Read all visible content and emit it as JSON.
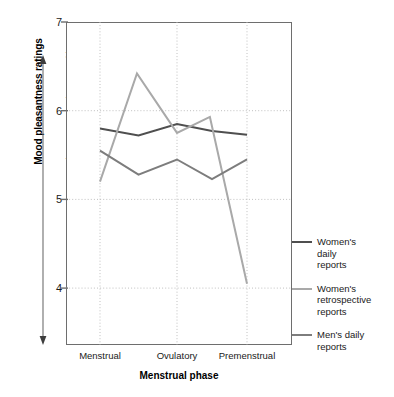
{
  "chart_data": {
    "type": "line",
    "title": "",
    "xlabel": "Menstrual phase",
    "ylabel": "Mood pleasantness ratings",
    "y_scale_low": "negative",
    "y_scale_mid": "neutral",
    "y_scale_high": "positive",
    "categories": [
      "Menstrual",
      "Ovulatory",
      "Premenstrual"
    ],
    "ylim": [
      3.2,
      7
    ],
    "yticks": [
      7,
      6,
      5,
      4
    ],
    "ytick_labels": [
      "7",
      "6",
      "5",
      "4"
    ],
    "grid": "dotted vertical at each phase, dotted horizontal at each y tick",
    "legend_position": "right",
    "series": [
      {
        "name": "Women's daily reports",
        "legend_label": "Women's\ndaily\nreports",
        "color": "#4f4f4f",
        "values": [
          5.8,
          5.85,
          5.73
        ],
        "vertices": [
          {
            "x": 0.0,
            "y": 5.8
          },
          {
            "x": 0.5,
            "y": 5.72
          },
          {
            "x": 1.0,
            "y": 5.85
          },
          {
            "x": 1.5,
            "y": 5.77
          },
          {
            "x": 2.0,
            "y": 5.73
          }
        ]
      },
      {
        "name": "Women's retrospective reports",
        "legend_label": "Women's\nretrospective\nreports",
        "color": "#a9a9a9",
        "values": [
          5.2,
          5.75,
          4.05
        ],
        "vertices": [
          {
            "x": 0.0,
            "y": 5.2
          },
          {
            "x": 0.48,
            "y": 6.42
          },
          {
            "x": 1.0,
            "y": 5.75
          },
          {
            "x": 1.47,
            "y": 5.93
          },
          {
            "x": 2.0,
            "y": 4.05
          }
        ]
      },
      {
        "name": "Men's daily reports",
        "legend_label": "Men's daily\nreports",
        "color": "#7d7d7d",
        "values": [
          5.55,
          5.45,
          5.45
        ],
        "vertices": [
          {
            "x": 0.0,
            "y": 5.55
          },
          {
            "x": 0.5,
            "y": 5.28
          },
          {
            "x": 1.0,
            "y": 5.45
          },
          {
            "x": 1.5,
            "y": 5.23
          },
          {
            "x": 2.0,
            "y": 5.45
          }
        ]
      }
    ]
  }
}
